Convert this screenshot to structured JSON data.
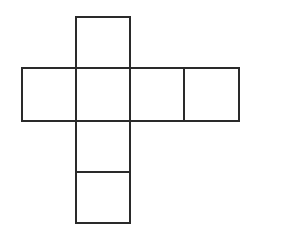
{
  "diagram": {
    "type": "cube-net",
    "stroke_color": "#2a2a2a",
    "background": "#ffffff",
    "squares": [
      {
        "id": "top",
        "x": 76,
        "y": 17,
        "w": 54,
        "h": 51
      },
      {
        "id": "left",
        "x": 22,
        "y": 68,
        "w": 54,
        "h": 53
      },
      {
        "id": "center",
        "x": 76,
        "y": 68,
        "w": 54,
        "h": 53
      },
      {
        "id": "right-1",
        "x": 130,
        "y": 68,
        "w": 54,
        "h": 53
      },
      {
        "id": "right-2",
        "x": 184,
        "y": 68,
        "w": 55,
        "h": 53
      },
      {
        "id": "bottom-1",
        "x": 76,
        "y": 121,
        "w": 54,
        "h": 51
      },
      {
        "id": "bottom-2",
        "x": 76,
        "y": 172,
        "w": 54,
        "h": 51
      }
    ]
  }
}
